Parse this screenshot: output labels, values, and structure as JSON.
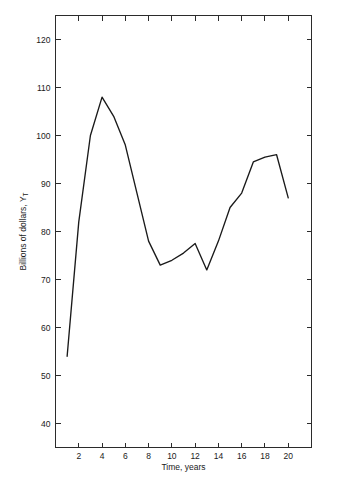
{
  "chart_data": {
    "type": "line",
    "title": "",
    "xlabel": "Time, years",
    "ylabel": "Billions of dollars, Y",
    "ylabel_subscript": "T",
    "x": [
      1,
      2,
      3,
      4,
      5,
      6,
      7,
      8,
      9,
      10,
      11,
      12,
      13,
      14,
      15,
      16,
      17,
      18,
      19,
      20
    ],
    "values": [
      54,
      82,
      100,
      108,
      104,
      98,
      88,
      78,
      73,
      74,
      75.5,
      77.5,
      72,
      78,
      85,
      88,
      94.5,
      95.5,
      96,
      87
    ],
    "series": [
      {
        "name": "Billions of dollars, Y_T",
        "values": [
          54,
          82,
          100,
          108,
          104,
          98,
          88,
          78,
          73,
          74,
          75.5,
          77.5,
          72,
          78,
          85,
          88,
          94.5,
          95.5,
          96,
          87
        ]
      }
    ],
    "xlim": [
      0,
      22
    ],
    "ylim": [
      35,
      125
    ],
    "xticks": [
      2,
      4,
      6,
      8,
      10,
      12,
      14,
      16,
      18,
      20
    ],
    "xtick_labels": [
      "2",
      "4",
      "6",
      "8",
      "10",
      "12",
      "14",
      "16",
      "18",
      "20"
    ],
    "xticks_unlabeled": [
      22
    ],
    "yticks": [
      40,
      50,
      60,
      70,
      80,
      90,
      100,
      110,
      120
    ],
    "ytick_labels": [
      "40",
      "50",
      "60",
      "70",
      "80",
      "90",
      "100",
      "110",
      "120"
    ],
    "grid": false,
    "legend": false,
    "legend_position": "none",
    "frame": "box",
    "tick_direction": "in",
    "line_color": "#1a1a1a",
    "background_color": "#ffffff",
    "axis_color": "#2b2b2b"
  }
}
